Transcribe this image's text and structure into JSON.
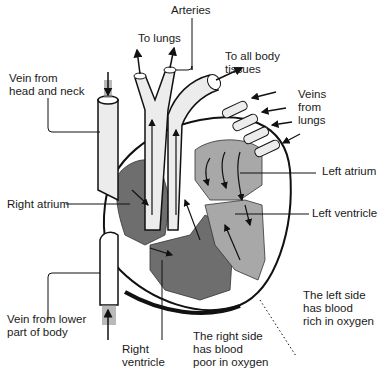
{
  "diagram": {
    "colors": {
      "background": "#ffffff",
      "outline": "#1a1a1a",
      "right_side_blood": "#6e6e6e",
      "left_side_blood": "#a8a8a8",
      "vessel_fill": "#ececec",
      "arrow_shadow": "#8a8a8a"
    },
    "labels": {
      "arteries": "Arteries",
      "to_lungs": "To lungs",
      "to_all_body_tissues": "To all body\ntissues",
      "vein_from_head_and_neck": "Vein from\nhead and neck",
      "veins_from_lungs": "Veins\nfrom\nlungs",
      "left_atrium": "Left atrium",
      "right_atrium": "Right atrium",
      "left_ventricle": "Left ventricle",
      "vein_from_lower_part_of_body": "Vein from lower\npart of body",
      "right_ventricle": "Right\nventricle",
      "right_side_note": "The right side\nhas blood\npoor in oxygen",
      "left_side_note": "The left side\nhas blood\nrich in oxygen"
    }
  }
}
